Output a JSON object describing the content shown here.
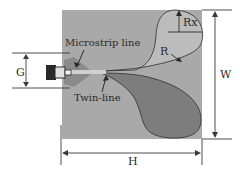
{
  "figure": {
    "type": "antenna-layout-diagram",
    "colors": {
      "board": "#a9a9a9",
      "top_lobe": "#bcbcbc",
      "bottom_lobe": "#7d7d7d",
      "lines": "#3a3a3a",
      "background": "#ffffff"
    },
    "labels": {
      "microstrip": "Microstrip line",
      "twinline": "Twin-line",
      "radius": "R",
      "radius_x": "Rx",
      "gap": "G",
      "width": "W",
      "height": "H"
    }
  }
}
